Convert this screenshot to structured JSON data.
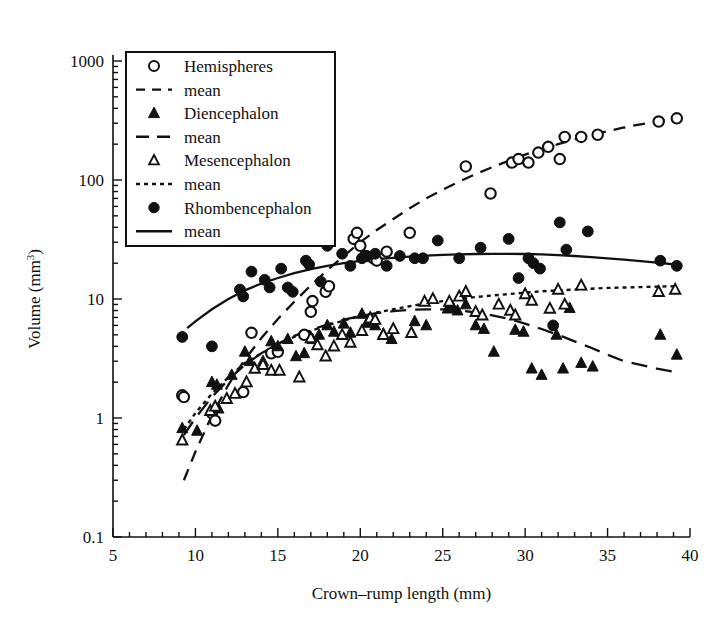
{
  "chart_data": {
    "type": "scatter",
    "title": "",
    "xlabel": "Crown–rump length (mm)",
    "ylabel": "Volume (mm³)",
    "ylabel_main": "Volume (mm",
    "ylabel_sup": "3",
    "ylabel_close": ")",
    "xlim": [
      5,
      40
    ],
    "ylim": [
      0.1,
      1000
    ],
    "yscale": "log",
    "xscale": "linear",
    "grid": false,
    "legend_position": "top-left inside, boxed",
    "xticks": [
      5,
      10,
      15,
      20,
      25,
      30,
      35,
      40
    ],
    "xtick_labels": [
      "5",
      "10",
      "15",
      "20",
      "25",
      "30",
      "35",
      "40"
    ],
    "xminor_step": 1,
    "yticks": [
      0.1,
      1,
      10,
      100,
      1000
    ],
    "ytick_labels": [
      "0.1",
      "1",
      "10",
      "100",
      "1000"
    ],
    "legend": [
      {
        "label": "Hemispheres",
        "marker": "open-circle",
        "line": "none"
      },
      {
        "label": "mean",
        "marker": "none",
        "line": "dashed-short"
      },
      {
        "label": "Diencephalon",
        "marker": "filled-triangle",
        "line": "none"
      },
      {
        "label": "mean",
        "marker": "none",
        "line": "dashed-long"
      },
      {
        "label": "Mesencephalon",
        "marker": "open-triangle",
        "line": "none"
      },
      {
        "label": "mean",
        "marker": "none",
        "line": "dotted"
      },
      {
        "label": "Rhombencephalon",
        "marker": "filled-circle",
        "line": "none"
      },
      {
        "label": "mean",
        "marker": "none",
        "line": "solid"
      }
    ],
    "series": [
      {
        "name": "Hemispheres",
        "marker": "open-circle",
        "points": [
          [
            9.2,
            1.55
          ],
          [
            9.3,
            1.5
          ],
          [
            11.0,
            1.1
          ],
          [
            11.2,
            0.95
          ],
          [
            12.9,
            1.65
          ],
          [
            13.4,
            5.2
          ],
          [
            14.6,
            3.5
          ],
          [
            15.0,
            3.6
          ],
          [
            16.6,
            5.0
          ],
          [
            17.0,
            7.8
          ],
          [
            17.1,
            9.6
          ],
          [
            17.9,
            11.5
          ],
          [
            18.1,
            12.8
          ],
          [
            19.6,
            32.0
          ],
          [
            19.8,
            36.0
          ],
          [
            20.0,
            28.0
          ],
          [
            20.3,
            23.0
          ],
          [
            20.8,
            22.0
          ],
          [
            21.0,
            21.0
          ],
          [
            21.6,
            25.0
          ],
          [
            23.0,
            36.0
          ],
          [
            26.4,
            130.0
          ],
          [
            27.9,
            77.0
          ],
          [
            29.2,
            140.0
          ],
          [
            29.6,
            150.0
          ],
          [
            30.2,
            140.0
          ],
          [
            30.8,
            170.0
          ],
          [
            31.4,
            190.0
          ],
          [
            32.1,
            150.0
          ],
          [
            32.4,
            230.0
          ],
          [
            33.4,
            230.0
          ],
          [
            34.4,
            240.0
          ],
          [
            38.1,
            310.0
          ],
          [
            39.2,
            330.0
          ]
        ]
      },
      {
        "name": "Diencephalon",
        "marker": "filled-triangle",
        "points": [
          [
            9.2,
            0.82
          ],
          [
            10.1,
            0.78
          ],
          [
            11.0,
            2.0
          ],
          [
            11.3,
            1.9
          ],
          [
            11.4,
            1.2
          ],
          [
            12.2,
            2.3
          ],
          [
            13.0,
            3.6
          ],
          [
            13.3,
            3.0
          ],
          [
            14.1,
            3.0
          ],
          [
            14.6,
            4.4
          ],
          [
            15.0,
            4.0
          ],
          [
            15.6,
            4.6
          ],
          [
            16.1,
            3.3
          ],
          [
            16.6,
            3.5
          ],
          [
            17.1,
            4.6
          ],
          [
            17.5,
            5.0
          ],
          [
            18.0,
            6.0
          ],
          [
            18.4,
            5.3
          ],
          [
            19.0,
            6.2
          ],
          [
            19.4,
            5.2
          ],
          [
            20.1,
            7.5
          ],
          [
            20.4,
            6.3
          ],
          [
            20.9,
            6.0
          ],
          [
            21.4,
            5.1
          ],
          [
            21.9,
            4.6
          ],
          [
            23.3,
            6.5
          ],
          [
            24.0,
            6.0
          ],
          [
            25.3,
            8.3
          ],
          [
            25.6,
            8.6
          ],
          [
            25.9,
            8.0
          ],
          [
            26.4,
            9.0
          ],
          [
            27.0,
            6.0
          ],
          [
            27.5,
            5.6
          ],
          [
            28.1,
            3.6
          ],
          [
            29.4,
            5.5
          ],
          [
            29.9,
            5.3
          ],
          [
            30.4,
            2.6
          ],
          [
            31.0,
            2.3
          ],
          [
            31.9,
            5.0
          ],
          [
            32.3,
            2.6
          ],
          [
            32.7,
            8.4
          ],
          [
            33.4,
            2.9
          ],
          [
            34.1,
            2.7
          ],
          [
            38.2,
            5.0
          ],
          [
            39.2,
            3.4
          ]
        ]
      },
      {
        "name": "Mesencephalon",
        "marker": "open-triangle",
        "points": [
          [
            9.2,
            0.65
          ],
          [
            10.9,
            1.15
          ],
          [
            11.2,
            1.25
          ],
          [
            11.9,
            1.45
          ],
          [
            12.4,
            1.6
          ],
          [
            13.1,
            2.0
          ],
          [
            13.6,
            2.6
          ],
          [
            14.1,
            2.8
          ],
          [
            14.6,
            2.5
          ],
          [
            15.1,
            2.5
          ],
          [
            16.3,
            2.2
          ],
          [
            17.0,
            4.7
          ],
          [
            17.4,
            4.1
          ],
          [
            17.9,
            3.3
          ],
          [
            18.4,
            4.0
          ],
          [
            18.9,
            5.0
          ],
          [
            19.4,
            4.3
          ],
          [
            20.1,
            5.4
          ],
          [
            20.6,
            6.9
          ],
          [
            20.9,
            6.7
          ],
          [
            21.4,
            5.0
          ],
          [
            22.0,
            5.6
          ],
          [
            23.1,
            5.2
          ],
          [
            23.9,
            9.5
          ],
          [
            24.4,
            10.0
          ],
          [
            25.4,
            9.5
          ],
          [
            26.0,
            10.5
          ],
          [
            26.4,
            11.5
          ],
          [
            27.0,
            7.8
          ],
          [
            27.4,
            7.3
          ],
          [
            28.4,
            9.0
          ],
          [
            29.1,
            8.0
          ],
          [
            29.4,
            7.3
          ],
          [
            30.0,
            11.0
          ],
          [
            30.4,
            9.7
          ],
          [
            31.5,
            8.3
          ],
          [
            32.0,
            12.0
          ],
          [
            32.4,
            9.0
          ],
          [
            33.4,
            13.0
          ],
          [
            38.1,
            11.5
          ],
          [
            39.1,
            12.0
          ]
        ]
      },
      {
        "name": "Rhombencephalon",
        "marker": "filled-circle",
        "points": [
          [
            9.2,
            4.8
          ],
          [
            11.0,
            4.0
          ],
          [
            12.7,
            12.0
          ],
          [
            12.9,
            10.5
          ],
          [
            13.4,
            17.0
          ],
          [
            14.2,
            14.5
          ],
          [
            14.5,
            12.5
          ],
          [
            15.2,
            18.0
          ],
          [
            15.6,
            12.5
          ],
          [
            15.9,
            11.5
          ],
          [
            16.7,
            21.0
          ],
          [
            16.9,
            19.5
          ],
          [
            17.6,
            14.0
          ],
          [
            18.0,
            28.0
          ],
          [
            18.9,
            24.0
          ],
          [
            19.4,
            19.0
          ],
          [
            20.1,
            22.0
          ],
          [
            20.4,
            23.0
          ],
          [
            20.9,
            24.0
          ],
          [
            21.6,
            19.0
          ],
          [
            22.4,
            23.0
          ],
          [
            23.3,
            22.0
          ],
          [
            23.8,
            22.0
          ],
          [
            24.7,
            31.0
          ],
          [
            26.0,
            22.0
          ],
          [
            27.3,
            27.0
          ],
          [
            29.0,
            32.0
          ],
          [
            29.6,
            15.0
          ],
          [
            30.2,
            22.0
          ],
          [
            30.5,
            20.0
          ],
          [
            30.9,
            18.0
          ],
          [
            31.7,
            6.0
          ],
          [
            32.1,
            44.0
          ],
          [
            32.5,
            26.0
          ],
          [
            33.8,
            37.0
          ],
          [
            38.2,
            21.0
          ],
          [
            39.2,
            19.0
          ]
        ]
      }
    ],
    "mean_curves": [
      {
        "name": "Hemispheres mean",
        "style": "dashed-short",
        "points": [
          [
            9.3,
            0.3
          ],
          [
            10.0,
            0.52
          ],
          [
            11.0,
            1.05
          ],
          [
            12.0,
            1.9
          ],
          [
            13.0,
            3.1
          ],
          [
            14.0,
            4.7
          ],
          [
            15.0,
            6.8
          ],
          [
            16.0,
            9.5
          ],
          [
            17.0,
            13.0
          ],
          [
            18.0,
            17.5
          ],
          [
            19.0,
            23.0
          ],
          [
            20.0,
            30.0
          ],
          [
            21.0,
            38.0
          ],
          [
            22.0,
            47.0
          ],
          [
            23.0,
            58.0
          ],
          [
            24.0,
            70.0
          ],
          [
            25.0,
            83.0
          ],
          [
            26.0,
            97.0
          ],
          [
            27.0,
            112.0
          ],
          [
            28.0,
            128.0
          ],
          [
            29.0,
            145.0
          ],
          [
            30.0,
            163.0
          ],
          [
            31.0,
            181.0
          ],
          [
            32.0,
            200.0
          ],
          [
            33.0,
            219.0
          ],
          [
            34.0,
            238.0
          ],
          [
            35.0,
            257.0
          ],
          [
            36.0,
            276.0
          ],
          [
            37.0,
            294.0
          ],
          [
            38.0,
            311.0
          ],
          [
            39.2,
            330.0
          ]
        ]
      },
      {
        "name": "Diencephalon mean",
        "style": "dashed-long",
        "points": [
          [
            9.3,
            0.72
          ],
          [
            10.0,
            1.0
          ],
          [
            11.0,
            1.5
          ],
          [
            12.0,
            2.1
          ],
          [
            13.0,
            2.8
          ],
          [
            14.0,
            3.5
          ],
          [
            15.0,
            4.2
          ],
          [
            16.0,
            4.9
          ],
          [
            17.0,
            5.5
          ],
          [
            18.0,
            6.1
          ],
          [
            19.0,
            6.7
          ],
          [
            20.0,
            7.2
          ],
          [
            21.0,
            7.6
          ],
          [
            22.0,
            7.9
          ],
          [
            23.0,
            8.1
          ],
          [
            24.0,
            8.2
          ],
          [
            25.0,
            8.2
          ],
          [
            26.0,
            8.0
          ],
          [
            27.0,
            7.7
          ],
          [
            28.0,
            7.3
          ],
          [
            29.0,
            6.8
          ],
          [
            30.0,
            6.2
          ],
          [
            31.0,
            5.6
          ],
          [
            32.0,
            5.0
          ],
          [
            33.0,
            4.4
          ],
          [
            34.0,
            3.9
          ],
          [
            35.0,
            3.4
          ],
          [
            36.0,
            3.0
          ],
          [
            37.0,
            2.8
          ],
          [
            38.0,
            2.6
          ],
          [
            39.4,
            2.4
          ]
        ]
      },
      {
        "name": "Mesencephalon mean",
        "style": "dotted",
        "points": [
          [
            9.3,
            0.8
          ],
          [
            10.0,
            1.1
          ],
          [
            11.0,
            1.6
          ],
          [
            12.0,
            2.2
          ],
          [
            13.0,
            2.9
          ],
          [
            14.0,
            3.5
          ],
          [
            15.0,
            4.2
          ],
          [
            16.0,
            4.8
          ],
          [
            17.0,
            5.4
          ],
          [
            18.0,
            6.0
          ],
          [
            19.0,
            6.6
          ],
          [
            20.0,
            7.2
          ],
          [
            21.0,
            7.7
          ],
          [
            22.0,
            8.2
          ],
          [
            23.0,
            8.7
          ],
          [
            24.0,
            9.2
          ],
          [
            25.0,
            9.6
          ],
          [
            26.0,
            10.0
          ],
          [
            27.0,
            10.4
          ],
          [
            28.0,
            10.7
          ],
          [
            29.0,
            11.0
          ],
          [
            30.0,
            11.3
          ],
          [
            31.0,
            11.6
          ],
          [
            32.0,
            11.8
          ],
          [
            33.0,
            12.0
          ],
          [
            34.0,
            12.2
          ],
          [
            35.0,
            12.4
          ],
          [
            36.0,
            12.5
          ],
          [
            37.0,
            12.6
          ],
          [
            38.0,
            12.7
          ],
          [
            39.3,
            12.8
          ]
        ]
      },
      {
        "name": "Rhombencephalon mean",
        "style": "solid",
        "points": [
          [
            9.5,
            5.7
          ],
          [
            10.0,
            6.5
          ],
          [
            11.0,
            8.2
          ],
          [
            12.0,
            10.0
          ],
          [
            13.0,
            11.8
          ],
          [
            14.0,
            13.5
          ],
          [
            15.0,
            15.0
          ],
          [
            16.0,
            16.5
          ],
          [
            17.0,
            17.8
          ],
          [
            18.0,
            19.0
          ],
          [
            19.0,
            20.0
          ],
          [
            20.0,
            20.9
          ],
          [
            21.0,
            21.6
          ],
          [
            22.0,
            22.2
          ],
          [
            23.0,
            22.7
          ],
          [
            24.0,
            23.1
          ],
          [
            25.0,
            23.5
          ],
          [
            26.0,
            23.7
          ],
          [
            27.0,
            23.9
          ],
          [
            28.0,
            24.0
          ],
          [
            29.0,
            24.0
          ],
          [
            30.0,
            23.9
          ],
          [
            31.0,
            23.7
          ],
          [
            32.0,
            23.4
          ],
          [
            33.0,
            23.0
          ],
          [
            34.0,
            22.5
          ],
          [
            35.0,
            22.0
          ],
          [
            36.0,
            21.4
          ],
          [
            37.0,
            20.8
          ],
          [
            38.0,
            20.2
          ],
          [
            39.4,
            19.3
          ]
        ]
      }
    ],
    "colors": {
      "ink": "#111111",
      "background": "#ffffff"
    }
  }
}
